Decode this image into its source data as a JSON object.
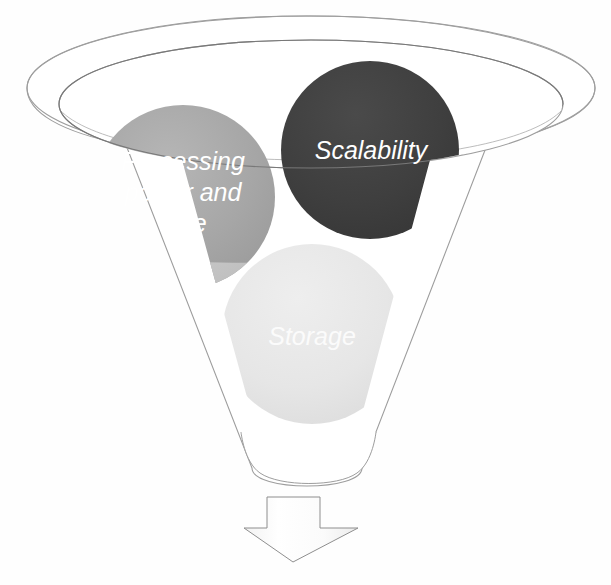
{
  "diagram": {
    "type": "funnel-with-bubbles",
    "background_color": "#fefefe"
  },
  "funnel": {
    "name": "funnel-shape",
    "outline_color": "#9a9a9a",
    "fill_color": "#ffffff",
    "rim": {
      "outer_label": "outer-rim-ellipse",
      "inner_label": "inner-rim-ellipse"
    }
  },
  "bubbles": [
    {
      "id": "processing",
      "label": "Processing power and time",
      "lines": [
        "Processing",
        "power and",
        "time"
      ],
      "color": "#a6a6a6",
      "submerged_color": "#cbcbcb",
      "text_color": "#ffffff",
      "cx": 183,
      "cy": 197,
      "r": 92
    },
    {
      "id": "scalability",
      "label": "Scalability",
      "lines": [
        "Scalability"
      ],
      "color": "#3f3f3f",
      "submerged_color": "#8c8c8c",
      "text_color": "#ffffff",
      "cx": 370,
      "cy": 150,
      "r": 89
    },
    {
      "id": "storage",
      "label": "Storage",
      "lines": [
        "Storage"
      ],
      "color": "#e6e6e6",
      "submerged_color": "#e6e6e6",
      "text_color": "#fbfbfb",
      "cx": 312,
      "cy": 334,
      "r": 90
    }
  ],
  "arrow": {
    "name": "down-arrow",
    "direction": "down",
    "fill_color": "#fdfdfd",
    "outline_color": "#8e8e8e"
  }
}
